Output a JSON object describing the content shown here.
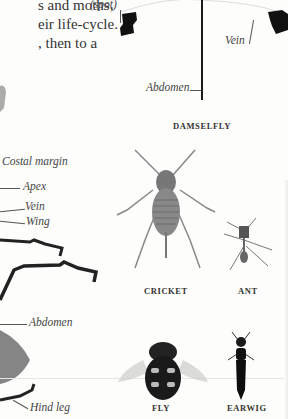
{
  "page": {
    "intro_text_lines": [
      "s and moths,",
      "eir life-cycle.",
      ", then to a"
    ]
  },
  "labels": {
    "spot": "(spot)",
    "vein_top": "Vein",
    "abdomen_top": "Abdomen",
    "costal_margin": "Costal margin",
    "apex": "Apex",
    "vein_left": "Vein",
    "wing": "Wing",
    "abdomen_left": "Abdomen",
    "hind_leg": "Hind leg"
  },
  "captions": {
    "damselfly": "DAMSELFLY",
    "cricket": "CRICKET",
    "ant": "ANT",
    "fly": "FLY",
    "earwig": "EARWIG"
  }
}
